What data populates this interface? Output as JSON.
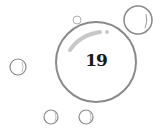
{
  "illustration": {
    "number": "19",
    "colors": {
      "bubble_stroke": "#8a8a8a",
      "highlight": "#c8c8c8",
      "text": "#1a1a1a"
    },
    "bubbles": [
      {
        "name": "main",
        "cx": 96,
        "cy": 62,
        "r": 40
      },
      {
        "name": "top-right",
        "cx": 138,
        "cy": 20,
        "r": 14
      },
      {
        "name": "top-small",
        "cx": 77,
        "cy": 20,
        "r": 4
      },
      {
        "name": "left",
        "cx": 18,
        "cy": 67,
        "r": 8
      },
      {
        "name": "bottom-left",
        "cx": 51,
        "cy": 117,
        "r": 7
      },
      {
        "name": "bottom-middle",
        "cx": 86,
        "cy": 117,
        "r": 7
      }
    ]
  }
}
